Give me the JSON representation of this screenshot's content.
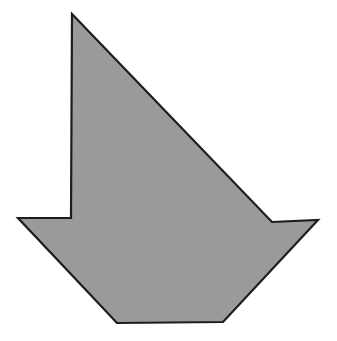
{
  "canvas": {
    "width": 337,
    "height": 341,
    "background_color": "#ffffff"
  },
  "figure": {
    "name": "arrow-polygon",
    "fill_color": "#9a9a9a",
    "stroke_color": "#1c1c1c",
    "stroke_width": 2.2,
    "vertex_count": 8,
    "points": "72,14 272,222 318,220 223,322 117,323 18,218 71,218 72,14",
    "vertices": [
      {
        "label": "top-apex",
        "x": 72,
        "y": 14
      },
      {
        "label": "right-notch",
        "x": 272,
        "y": 222
      },
      {
        "label": "right-barb-tip",
        "x": 318,
        "y": 220
      },
      {
        "label": "base-right",
        "x": 223,
        "y": 322
      },
      {
        "label": "base-left",
        "x": 117,
        "y": 323
      },
      {
        "label": "left-barb-tip",
        "x": 18,
        "y": 218
      },
      {
        "label": "left-notch",
        "x": 71,
        "y": 218
      },
      {
        "label": "shaft-top",
        "x": 72,
        "y": 14
      }
    ]
  }
}
